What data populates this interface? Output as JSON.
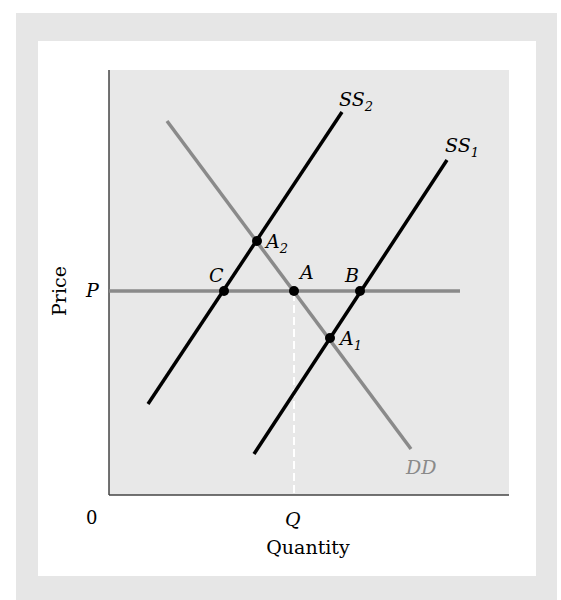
{
  "diagram": {
    "axes": {
      "y_label": "Price",
      "x_label": "Quantity",
      "origin_label": "0",
      "price_tick": "P",
      "quantity_tick": "Q"
    },
    "curves": {
      "ss2": {
        "name": "SS",
        "sub": "2"
      },
      "ss1": {
        "name": "SS",
        "sub": "1"
      },
      "dd": {
        "name": "DD"
      }
    },
    "points": {
      "a2": {
        "name": "A",
        "sub": "2"
      },
      "c": {
        "name": "C"
      },
      "a": {
        "name": "A"
      },
      "b": {
        "name": "B"
      },
      "a1": {
        "name": "A",
        "sub": "1"
      }
    },
    "colors": {
      "supply": "#000000",
      "demand": "#8a8a8a",
      "price_line": "#8a8a8a",
      "plot_bg": "#e8e8e8",
      "frame": "#e6e6e6",
      "dd_label": "#8a8a8a"
    }
  }
}
